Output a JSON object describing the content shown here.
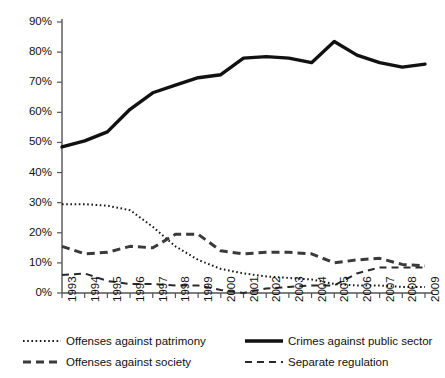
{
  "chart_data": {
    "type": "line",
    "title": "",
    "xlabel": "",
    "ylabel": "",
    "grid": false,
    "legend_position": "bottom",
    "ylim": [
      0,
      90
    ],
    "ytick_labels": [
      "0%",
      "10%",
      "20%",
      "30%",
      "40%",
      "50%",
      "60%",
      "70%",
      "80%",
      "90%"
    ],
    "ytick_values": [
      0,
      10,
      20,
      30,
      40,
      50,
      60,
      70,
      80,
      90
    ],
    "categories": [
      "1993",
      "1994",
      "1995",
      "1996",
      "1997",
      "1998",
      "1999",
      "2000",
      "2001",
      "2002",
      "2003",
      "2004",
      "2005",
      "2006",
      "2007",
      "2008",
      "2009"
    ],
    "series": [
      {
        "name": "Offenses against patrimony",
        "style": "dotted",
        "color": "#1a1a1a",
        "values": [
          29.5,
          29.5,
          29.0,
          27.5,
          22.0,
          15.5,
          11.0,
          8.0,
          6.5,
          5.5,
          5.0,
          4.5,
          3.0,
          2.5,
          2.5,
          2.0,
          2.0
        ]
      },
      {
        "name": "Crimes against public sector",
        "style": "solid",
        "color": "#111111",
        "values": [
          48.5,
          50.5,
          53.5,
          61.0,
          66.5,
          69.0,
          71.5,
          72.5,
          78.0,
          78.5,
          78.0,
          76.5,
          83.5,
          79.0,
          76.5,
          75.0,
          76.0
        ]
      },
      {
        "name": "Offenses against society",
        "style": "dashed-thick",
        "color": "#3a3a3a",
        "values": [
          15.5,
          13.0,
          13.5,
          15.5,
          15.0,
          19.5,
          19.5,
          14.0,
          13.0,
          13.5,
          13.5,
          13.0,
          10.0,
          11.0,
          11.5,
          9.5,
          9.0
        ]
      },
      {
        "name": "Separate regulation",
        "style": "dashed-thin",
        "color": "#2a2a2a",
        "values": [
          6.0,
          6.5,
          4.0,
          3.0,
          3.0,
          2.5,
          2.5,
          1.0,
          0.0,
          1.5,
          2.0,
          2.5,
          2.5,
          6.5,
          8.5,
          8.5,
          8.5
        ]
      }
    ]
  },
  "legend": {
    "items": [
      {
        "label": "Offenses against patrimony",
        "style": "dotted"
      },
      {
        "label": "Crimes against public sector",
        "style": "solid"
      },
      {
        "label": "Offenses against society",
        "style": "dashed-thick"
      },
      {
        "label": "Separate regulation",
        "style": "dashed-thin"
      }
    ]
  }
}
